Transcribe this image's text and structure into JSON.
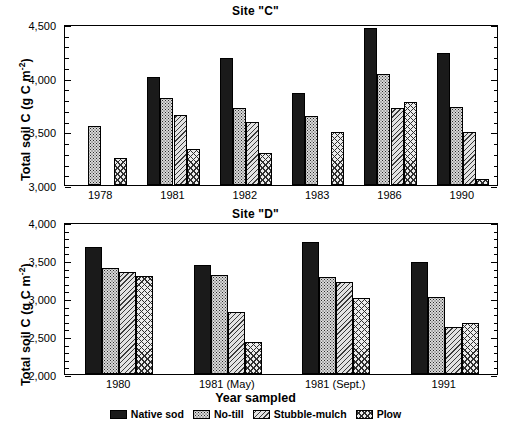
{
  "figure": {
    "xlabel": "Year sampled",
    "ylabel_prefix": "Total soil C (g C m",
    "ylabel_exp": "-2",
    "ylabel_suffix": ")"
  },
  "legend": {
    "items": [
      {
        "label": "Native sod",
        "pattern": "solid",
        "swatch_name": "legend-swatch-native-sod"
      },
      {
        "label": "No-till",
        "pattern": "dots",
        "swatch_name": "legend-swatch-no-till"
      },
      {
        "label": "Stubble-mulch",
        "pattern": "diag",
        "swatch_name": "legend-swatch-stubble-mulch"
      },
      {
        "label": "Plow",
        "pattern": "cross",
        "swatch_name": "legend-swatch-plow"
      }
    ]
  },
  "chart_data": [
    {
      "type": "bar",
      "title": "Site \"C\"",
      "panel": "top",
      "xlabel": "",
      "ylabel": "Total soil C (g C m-2)",
      "ylim": [
        3000,
        4500
      ],
      "ytick_step": 500,
      "yminor_step": 100,
      "ytick_labels": [
        "3,000",
        "3,500",
        "4,000",
        "4,500"
      ],
      "grid": false,
      "legend_position": "bottom-figure",
      "categories": [
        "1978",
        "1981",
        "1982",
        "1983",
        "1986",
        "1990"
      ],
      "series": [
        {
          "name": "Native sod",
          "pattern": "solid",
          "values": [
            null,
            4010,
            4185,
            3860,
            4460,
            4230
          ]
        },
        {
          "name": "No-till",
          "pattern": "dots",
          "values": [
            3550,
            3810,
            3715,
            3640,
            4035,
            3725
          ]
        },
        {
          "name": "Stubble-mulch",
          "pattern": "diag",
          "values": [
            null,
            3650,
            3585,
            null,
            3720,
            3490
          ]
        },
        {
          "name": "Plow",
          "pattern": "cross",
          "values": [
            3250,
            3340,
            3295,
            3490,
            3770,
            3060
          ]
        }
      ]
    },
    {
      "type": "bar",
      "title": "Site \"D\"",
      "panel": "bottom",
      "xlabel": "Year sampled",
      "ylabel": "Total soil C (g C m-2)",
      "ylim": [
        2000,
        4000
      ],
      "ytick_step": 500,
      "yminor_step": 100,
      "ytick_labels": [
        "2,000",
        "2,500",
        "3,000",
        "3,500",
        "4,000"
      ],
      "grid": false,
      "legend_position": "bottom-figure",
      "categories": [
        "1980",
        "1981 (May)",
        "1981 (Sept.)",
        "1991"
      ],
      "series": [
        {
          "name": "Native sod",
          "pattern": "solid",
          "values": [
            3670,
            3435,
            3740,
            3475
          ]
        },
        {
          "name": "No-till",
          "pattern": "dots",
          "values": [
            3390,
            3305,
            3280,
            3010
          ]
        },
        {
          "name": "Stubble-mulch",
          "pattern": "diag",
          "values": [
            3345,
            2810,
            3215,
            2625
          ]
        },
        {
          "name": "Plow",
          "pattern": "cross",
          "values": [
            3285,
            2420,
            2995,
            2670
          ]
        }
      ]
    }
  ]
}
